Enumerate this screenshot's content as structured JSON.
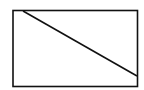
{
  "diagram": {
    "background": "#ffffff",
    "stroke": "#111111",
    "rectangle": {
      "x": 13,
      "y": 10.5,
      "width": 124.5,
      "height": 76
    },
    "diagonal": {
      "x1": 23,
      "y1": 11,
      "x2": 137,
      "y2": 76
    }
  }
}
